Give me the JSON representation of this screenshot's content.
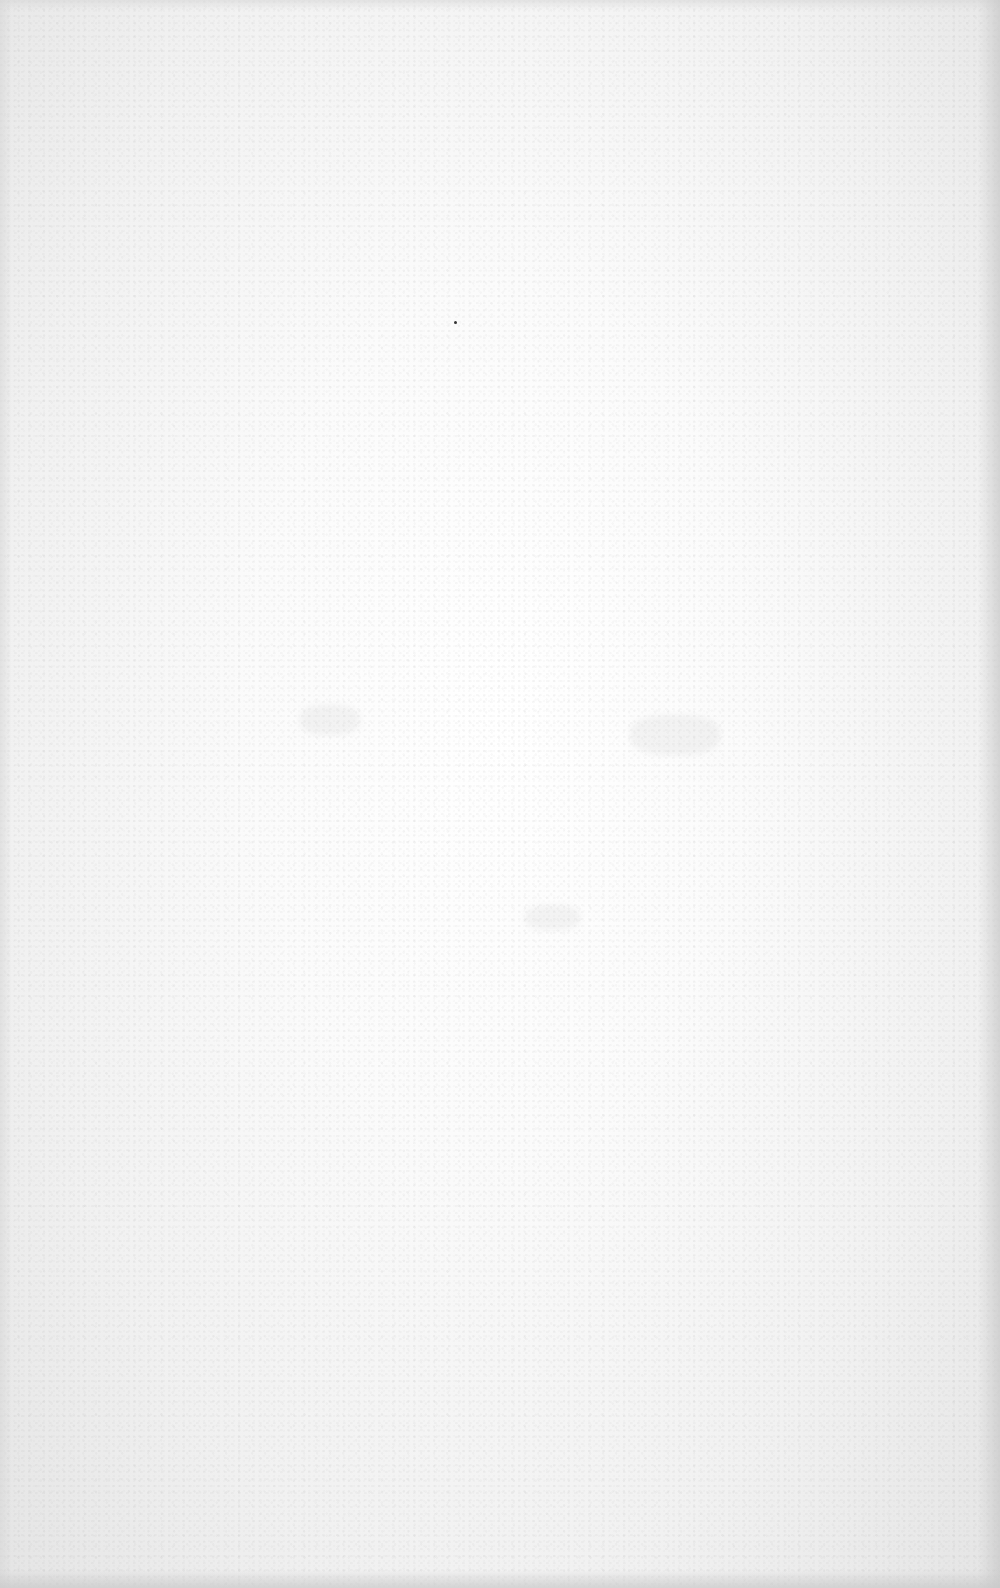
{
  "document": {
    "description": "Blank scanned paper page",
    "content": ""
  },
  "colors": {
    "paper": "#fdfdfd",
    "edge_shadow": "#d4d4d4",
    "speck": "#333333"
  }
}
